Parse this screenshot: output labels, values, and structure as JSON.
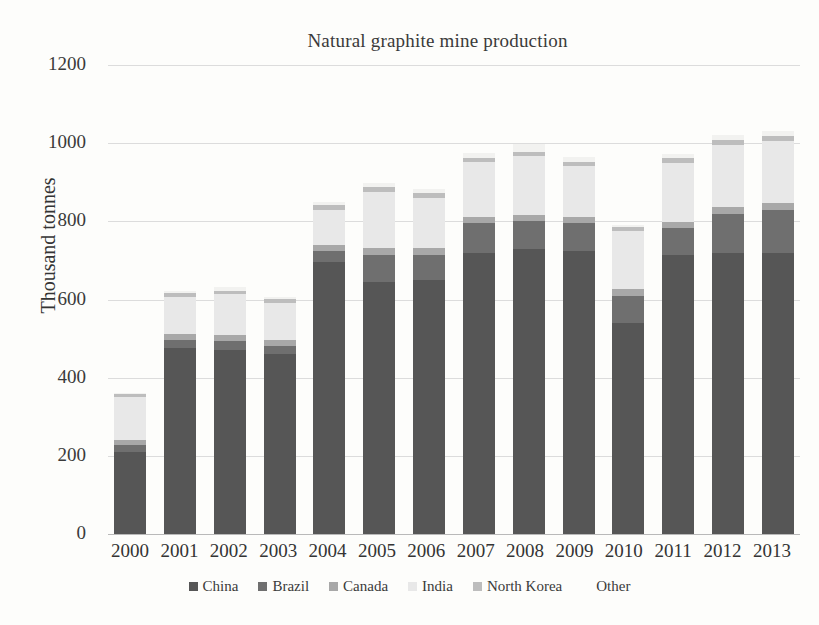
{
  "chart_data": {
    "type": "bar",
    "title": "Natural graphite mine production",
    "xlabel": "",
    "ylabel": "Thousand tonnes",
    "ylim": [
      0,
      1200
    ],
    "yticks": [
      0,
      200,
      400,
      600,
      800,
      1000,
      1200
    ],
    "grid": true,
    "stacked": true,
    "legend_position": "bottom",
    "categories": [
      "2000",
      "2001",
      "2002",
      "2003",
      "2004",
      "2005",
      "2006",
      "2007",
      "2008",
      "2009",
      "2010",
      "2011",
      "2012",
      "2013"
    ],
    "series": [
      {
        "name": "China",
        "color": "#565656",
        "values": [
          210,
          475,
          470,
          460,
          695,
          645,
          650,
          720,
          730,
          725,
          540,
          715,
          720,
          720
        ]
      },
      {
        "name": "Brazil",
        "color": "#6f6f6f",
        "values": [
          18,
          22,
          24,
          22,
          28,
          70,
          65,
          75,
          70,
          70,
          70,
          68,
          100,
          110
        ]
      },
      {
        "name": "Canada",
        "color": "#a8a8a8",
        "values": [
          12,
          14,
          14,
          14,
          16,
          16,
          16,
          16,
          16,
          16,
          16,
          16,
          16,
          16
        ]
      },
      {
        "name": "India",
        "color": "#e8e8e8",
        "values": [
          110,
          95,
          105,
          95,
          90,
          145,
          130,
          140,
          150,
          130,
          150,
          150,
          160,
          160
        ]
      },
      {
        "name": "North Korea",
        "color": "#bdbdbd",
        "values": [
          8,
          10,
          10,
          10,
          12,
          12,
          12,
          12,
          12,
          12,
          10,
          12,
          12,
          12
        ]
      },
      {
        "name": "Other",
        "color": "#f2f2f0",
        "values": [
          2,
          6,
          8,
          6,
          8,
          10,
          10,
          12,
          20,
          12,
          4,
          12,
          12,
          12
        ]
      }
    ]
  },
  "legend": {
    "items": [
      {
        "label": "China"
      },
      {
        "label": "Brazil"
      },
      {
        "label": "Canada"
      },
      {
        "label": "India"
      },
      {
        "label": "North Korea"
      },
      {
        "label": "Other"
      }
    ]
  }
}
